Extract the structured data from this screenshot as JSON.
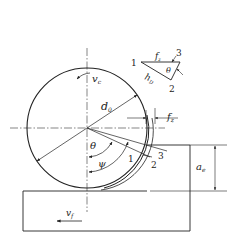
{
  "figure": {
    "colors": {
      "line": "#222222",
      "background": "#ffffff"
    }
  },
  "labels": {
    "cutting_speed": "v",
    "cutting_speed_sub": "c",
    "diameter": "d",
    "diameter_sub": "0",
    "feed_per_tooth": "f",
    "feed_per_tooth_sub": "z",
    "theta": "θ",
    "phi": "ψ",
    "engagement": "a",
    "engagement_sub": "e",
    "feed_speed": "v",
    "feed_speed_sub": "f",
    "point_1": "1",
    "point_2": "2",
    "point_3": "3"
  },
  "inset": {
    "point_1": "1",
    "point_2": "2",
    "point_3": "3",
    "fz": "f",
    "fz_sub": "z",
    "hD": "h",
    "hD_sub": "D",
    "theta": "θ"
  }
}
